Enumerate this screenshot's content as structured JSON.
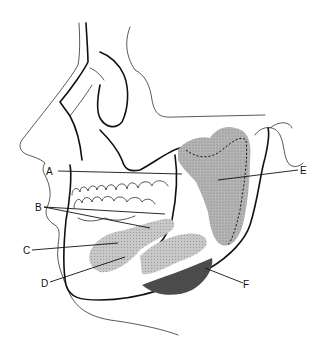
{
  "figure": {
    "labels": [
      {
        "id": "A",
        "text": "A",
        "x": 52,
        "y": 174
      },
      {
        "id": "B",
        "text": "B",
        "x": 37,
        "y": 210
      },
      {
        "id": "C",
        "text": "C",
        "x": 25,
        "y": 252
      },
      {
        "id": "D",
        "text": "D",
        "x": 43,
        "y": 285
      },
      {
        "id": "E",
        "text": "E",
        "x": 302,
        "y": 173
      },
      {
        "id": "F",
        "text": "F",
        "x": 245,
        "y": 286
      }
    ]
  },
  "colors": {
    "line": "#111111",
    "gland_light": "#b9b9b9",
    "gland_medium": "#a0a0a0",
    "gland_dark": "#4a4a4a",
    "background": "#ffffff"
  }
}
